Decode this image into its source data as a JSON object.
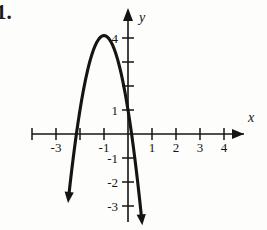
{
  "figure": {
    "problem_number": "1.",
    "background_color": "#fdfdfc",
    "ink_color": "#141414"
  },
  "axes": {
    "x_axis_label": "x",
    "y_axis_label": "y",
    "origin_px": [
      128,
      134
    ],
    "unit_px": 24,
    "x_tick_labels": [
      "-3",
      "-1",
      "1",
      "2",
      "3",
      "4"
    ],
    "y_tick_labels": [
      "4",
      "1",
      "-1",
      "-2",
      "-3"
    ],
    "x_label_3_neg": "-3",
    "x_label_1_neg": "-1",
    "x_label_1": "1",
    "x_label_2": "2",
    "x_label_3": "3",
    "x_label_4": "4",
    "y_label_4": "4",
    "y_label_1": "1",
    "y_label_1_neg": "-1",
    "y_label_2_neg": "-2",
    "y_label_3_neg": "-3"
  },
  "chart_data": {
    "type": "line",
    "title": "",
    "xlabel": "x",
    "ylabel": "y",
    "xlim": [
      -4.6,
      5.3
    ],
    "ylim": [
      -4.2,
      5.2
    ],
    "grid": false,
    "legend": null,
    "curve_name": "downward parabola",
    "vertex": [
      -1,
      4.1
    ],
    "y_intercept": 1,
    "x_intercepts": [
      -2.2,
      0.2
    ],
    "leading_coefficient": -3.1,
    "equation": "y = -3.1(x + 1)^2 + 4.1",
    "x": [
      -2.45,
      -2.3,
      -2.15,
      -2.0,
      -1.85,
      -1.7,
      -1.55,
      -1.4,
      -1.25,
      -1.1,
      -1.0,
      -0.9,
      -0.75,
      -0.6,
      -0.45,
      -0.3,
      -0.15,
      0,
      0.15,
      0.3,
      0.45,
      0.5
    ],
    "y": [
      -2.67,
      -1.13,
      0.19,
      1.33,
      2.24,
      2.94,
      3.44,
      3.72,
      3.91,
      4.07,
      4.1,
      4.07,
      3.91,
      3.6,
      3.13,
      2.58,
      1.82,
      0.97,
      0.0,
      -1.13,
      -2.36,
      -2.87
    ],
    "arrow_endpoints": [
      [
        -2.45,
        -3.5
      ],
      [
        0.55,
        -3.5
      ]
    ],
    "x_ticks": [
      -4,
      -3,
      -2,
      -1,
      1,
      2,
      3,
      4
    ],
    "y_ticks": [
      4,
      3,
      2,
      1,
      -1,
      -2,
      -3
    ]
  }
}
